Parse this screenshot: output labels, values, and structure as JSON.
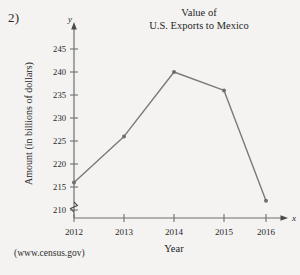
{
  "problem": {
    "number_label": "2)"
  },
  "source": {
    "citation": "(www.census.gov)"
  },
  "chart_data": {
    "type": "line",
    "title": "Value of U.S. Exports to Mexico",
    "title_lines": [
      "Value of",
      "U.S. Exports to Mexico"
    ],
    "xlabel": "Year",
    "ylabel": "Amount (in billions of dollars)",
    "x_axis_symbol": "x",
    "y_axis_symbol": "y",
    "categories": [
      "2012",
      "2013",
      "2014",
      "2015",
      "2016"
    ],
    "x": [
      2012,
      2013,
      2014,
      2015,
      2016
    ],
    "values": [
      216,
      226,
      240,
      236,
      212
    ],
    "ylim": [
      208,
      247
    ],
    "ytick_values": [
      210,
      215,
      220,
      225,
      230,
      235,
      240,
      245
    ],
    "ytick_labels": [
      "210",
      "215",
      "220",
      "225",
      "230",
      "235",
      "240",
      "245"
    ],
    "xtick_labels": [
      "2012",
      "2013",
      "2014",
      "2015",
      "2016"
    ],
    "axis_break": true,
    "axis_break_note": "zigzag break on y-axis below 210",
    "grid": false,
    "legend": false,
    "series": [
      {
        "name": "U.S. Exports to Mexico",
        "values": [
          216,
          226,
          240,
          236,
          212
        ]
      }
    ],
    "colors": {
      "line": "#7a7a7a",
      "marker": "#6e6e6e",
      "axis": "#6f6f6f",
      "text": "#262626",
      "background": "#f4f3f1"
    }
  }
}
